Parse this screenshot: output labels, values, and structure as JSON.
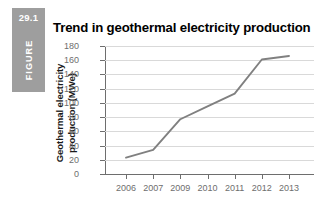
{
  "figure": {
    "number": "29.1",
    "word": "FIGURE",
    "badge_color": "#9e9e9e"
  },
  "title": "Trend in geothermal electricity production",
  "chart_data": {
    "type": "line",
    "title": "Trend in geothermal electricity production",
    "xlabel": "",
    "ylabel": "Geothermal electricity production (MWe)",
    "ylabel_line1": "Geothermal electricity",
    "ylabel_line2": "production (MWe)",
    "categories": [
      "2006",
      "2007",
      "2009",
      "2010",
      "2011",
      "2012",
      "2013"
    ],
    "values": [
      23,
      34,
      77,
      95,
      113,
      161,
      166
    ],
    "series": [
      {
        "name": "Geothermal electricity production",
        "values": [
          23,
          34,
          77,
          95,
          113,
          161,
          166
        ],
        "color": "#808080"
      }
    ],
    "ylim": [
      0,
      180
    ],
    "ytick_step": 20,
    "yticks": [
      0,
      20,
      40,
      60,
      80,
      100,
      120,
      140,
      160,
      180
    ],
    "ytick_labels": [
      "0",
      "20",
      "40",
      "60",
      "80",
      "100",
      "120",
      "140",
      "160",
      "180"
    ],
    "grid": true,
    "grid_color": "#d9d9d9",
    "axis_color": "#6e6e6e",
    "tick_text_color": "#6e6e6e",
    "legend": false,
    "legend_position": "none"
  }
}
